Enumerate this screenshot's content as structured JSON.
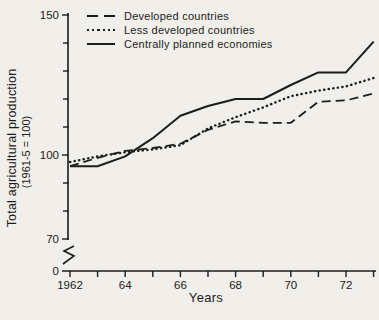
{
  "figure": {
    "background_color": "#f1efe9",
    "ink_color": "#1c1c1c"
  },
  "chart_data": {
    "type": "line",
    "title": "",
    "xlabel": "Years",
    "ylabel": "Total agricultural production",
    "ylabel_sub": "(1961-5 = 100)",
    "legend_position": "top-left",
    "grid": false,
    "x": [
      1962,
      1963,
      1964,
      1965,
      1966,
      1967,
      1968,
      1969,
      1970,
      1971,
      1972,
      1973
    ],
    "series": [
      {
        "name": "Developed countries",
        "style": "dashed",
        "values": [
          96,
          99,
          101.5,
          102.5,
          104,
          109,
          112,
          111.5,
          111.5,
          119,
          119.5,
          122
        ]
      },
      {
        "name": "Less developed countries",
        "style": "dotted",
        "values": [
          97.5,
          99.5,
          101,
          102,
          103.5,
          109.5,
          113.5,
          117,
          121,
          123,
          124.5,
          127.5
        ]
      },
      {
        "name": "Centrally planned economies",
        "style": "solid",
        "values": [
          96,
          96,
          99.5,
          106,
          114,
          117.5,
          120,
          120,
          125,
          129.5,
          129.5,
          140.5
        ]
      }
    ],
    "y_axis": {
      "shown_range": [
        70,
        150
      ],
      "major_ticks": [
        {
          "value": 150,
          "label": "150"
        },
        {
          "value": 100,
          "label": "100"
        },
        {
          "value": 70,
          "label": "70"
        }
      ],
      "minor_tick_values": [
        140,
        130,
        120,
        110,
        90,
        80
      ],
      "zero_label": "0",
      "axis_break": true
    },
    "x_axis": {
      "tick_values": [
        1962,
        1963,
        1964,
        1965,
        1966,
        1967,
        1968,
        1969,
        1970,
        1971,
        1972,
        1973
      ],
      "labels": [
        {
          "value": 1962,
          "label": "1962"
        },
        {
          "value": 1964,
          "label": "64"
        },
        {
          "value": 1966,
          "label": "66"
        },
        {
          "value": 1968,
          "label": "68"
        },
        {
          "value": 1970,
          "label": "70"
        },
        {
          "value": 1972,
          "label": "72"
        }
      ]
    }
  }
}
